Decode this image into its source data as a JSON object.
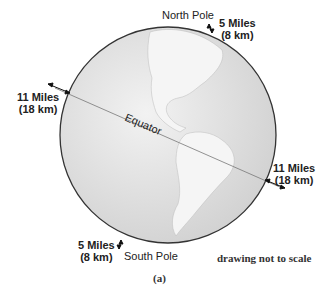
{
  "diagram": {
    "labels": {
      "north_pole": "North Pole",
      "south_pole": "South Pole",
      "equator": "Equator",
      "north_thickness_miles": "5 Miles",
      "north_thickness_km": "(8 km)",
      "south_thickness_miles": "5 Miles",
      "south_thickness_km": "(8 km)",
      "west_equator_miles": "11 Miles",
      "west_equator_km": "(18 km)",
      "east_equator_miles": "11 Miles",
      "east_equator_km": "(18 km)",
      "note": "drawing not to scale",
      "caption": "(a)"
    },
    "colors": {
      "ocean": "#e6e6e6",
      "land": "#f4f4f4",
      "outline": "#333333"
    }
  }
}
